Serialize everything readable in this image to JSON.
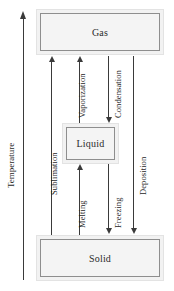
{
  "diagram": {
    "axis": {
      "label": "Temperature",
      "direction": "up",
      "arrow_icon": "arrow-up-icon"
    },
    "phases": [
      {
        "id": "gas",
        "label": "Gas"
      },
      {
        "id": "liquid",
        "label": "Liquid"
      },
      {
        "id": "solid",
        "label": "Solid"
      }
    ],
    "transitions": [
      {
        "id": "sublimation",
        "label": "Sublimation",
        "from": "Solid",
        "to": "Gas",
        "direction": "up"
      },
      {
        "id": "vaporization",
        "label": "Vaporization",
        "from": "Liquid",
        "to": "Gas",
        "direction": "up"
      },
      {
        "id": "melting",
        "label": "Melting",
        "from": "Solid",
        "to": "Liquid",
        "direction": "up"
      },
      {
        "id": "condensation",
        "label": "Condensation",
        "from": "Gas",
        "to": "Liquid",
        "direction": "down"
      },
      {
        "id": "freezing",
        "label": "Freezing",
        "from": "Liquid",
        "to": "Solid",
        "direction": "down"
      },
      {
        "id": "deposition",
        "label": "Deposition",
        "from": "Gas",
        "to": "Solid",
        "direction": "down"
      }
    ],
    "colors": {
      "box_fill": "#f2f2f2",
      "box_inner_border": "#8e8e8e",
      "box_outer_border": "#e3e3e3",
      "arrow": "#3a3a3a",
      "text": "#1f1f1f",
      "background": "#ffffff"
    }
  }
}
